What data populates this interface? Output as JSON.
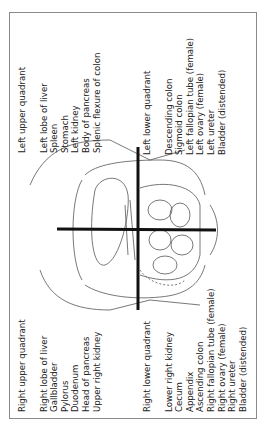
{
  "orientation": "rotated-90-ccw",
  "quadrants": {
    "left_upper": {
      "title": "Left upper quadrant",
      "items": [
        "Left lobe of liver",
        "Spleen",
        "Stomach",
        "Left kidney",
        "Body of pancreas",
        "Splenic flexure of colon"
      ]
    },
    "left_lower": {
      "title": "Left lower quadrant",
      "items": [
        "Descending colon",
        "Sigmoid colon",
        "Left fallopian tube (female)",
        "Left ovary (female)",
        "Left ureter",
        "Bladder (distended)"
      ]
    },
    "right_upper": {
      "title": "Right upper quadrant",
      "items": [
        "Right lobe of liver",
        "Gallbladder",
        "Pylorus",
        "Duodenum",
        "Head of pancreas",
        "Upper right kidney"
      ]
    },
    "right_lower": {
      "title": "Right lower quadrant",
      "items": [
        "Lower right kidney",
        "Cecum",
        "Appendix",
        "Ascending colon",
        "Right fallopian tube (female)",
        "Right ovary (female)",
        "Right ureter",
        "Bladder (distended)"
      ]
    }
  },
  "colors": {
    "line": "#111111",
    "frame": "#8a8a8a",
    "sketch": "#444444"
  }
}
